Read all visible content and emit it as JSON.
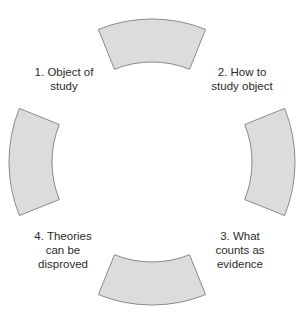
{
  "diagram": {
    "type": "cycle",
    "style": {
      "segment_fill": "#dcdcdc",
      "segment_stroke": "#8a8a8a",
      "text_color": "#2b2b2b",
      "background": "#ffffff"
    },
    "segments": [
      {
        "position": "top"
      },
      {
        "position": "right"
      },
      {
        "position": "bottom"
      },
      {
        "position": "left"
      }
    ],
    "steps": [
      {
        "number": "1",
        "lines": [
          "1. Object of",
          "study"
        ],
        "position": "top-left"
      },
      {
        "number": "2",
        "lines": [
          "2. How to",
          "study object"
        ],
        "position": "top-right"
      },
      {
        "number": "3",
        "lines": [
          "3. What",
          "counts as",
          "evidence"
        ],
        "position": "bottom-right"
      },
      {
        "number": "4",
        "lines": [
          "4. Theories",
          "can be",
          "disproved"
        ],
        "position": "bottom-left"
      }
    ]
  }
}
